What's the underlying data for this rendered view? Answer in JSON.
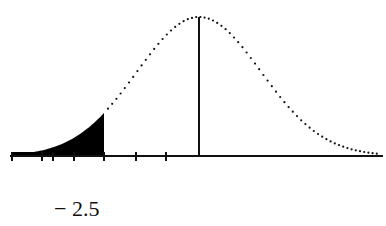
{
  "chart_data": {
    "type": "area",
    "title": "",
    "xlabel": "",
    "ylabel": "",
    "mean": 0,
    "std": 1,
    "cutoff_label": "− 2.5",
    "cutoff_value": -2.5,
    "shaded_region": "left tail (x < cutoff)",
    "curve_style": "dotted",
    "mean_line": true,
    "tick_marks_count": 7,
    "grid": false,
    "legend": null
  },
  "colors": {
    "ink": "#111111",
    "background": "#ffffff",
    "shade": "#000000"
  },
  "labels": {
    "cutoff": "− 2.5"
  }
}
